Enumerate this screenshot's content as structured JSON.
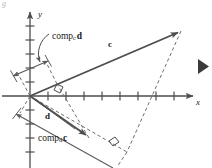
{
  "figure": {
    "corner_mark": "g",
    "background_color": "#ffffff",
    "stroke_color": "#4d4d4d",
    "dash_color": "#6e6e6e",
    "text_color": "#1a1a1a"
  },
  "axes": {
    "x_label": "x",
    "y_label": "y",
    "x_tick_count": 9,
    "y_tick_count_positive": 5,
    "y_tick_count_negative": 4,
    "origin": {
      "x": 30,
      "y": 96
    }
  },
  "vectors": [
    {
      "name": "vector-c",
      "label": "c",
      "bold": true,
      "label_x": 108,
      "label_y": 44,
      "from": {
        "x": 30,
        "y": 96
      },
      "to": {
        "x": 181,
        "y": 31
      }
    },
    {
      "name": "vector-d",
      "label": "d",
      "bold": true,
      "label_x": 45,
      "label_y": 116,
      "from": {
        "x": 30,
        "y": 96
      },
      "to": {
        "x": 75,
        "y": 129
      }
    }
  ],
  "projections": [
    {
      "name": "comp-c-d",
      "base": "comp",
      "subscript": "c",
      "vector": "d",
      "label_x": 52,
      "label_y": 38
    },
    {
      "name": "comp-d-c",
      "base": "comp",
      "subscript": "d",
      "vector": "c",
      "label_x": 40,
      "label_y": 139
    }
  ],
  "markers": {
    "right_angle_upper": {
      "x": 60,
      "y": 88
    },
    "right_angle_lower": {
      "x": 110,
      "y": 141
    },
    "play_triangle": {
      "x": 201,
      "y": 66
    }
  }
}
